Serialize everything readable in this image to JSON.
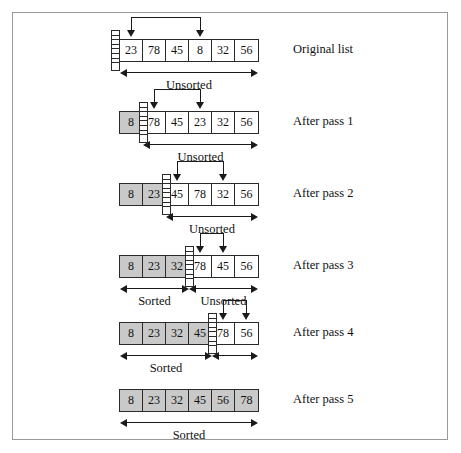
{
  "figure": {
    "type": "selection-sort-diagram",
    "cell_width": 23,
    "cell_height": 21,
    "array_left": 118,
    "colors": {
      "shaded_cell": "#c9c9c9",
      "plain_cell": "#ffffff",
      "stroke": "#2b2b2b",
      "frame": "#9a9a9a"
    }
  },
  "rows": [
    {
      "id": "original",
      "label": "Original list",
      "top": 38,
      "values": [
        "23",
        "78",
        "45",
        "8",
        "32",
        "56"
      ],
      "sorted_count": 0,
      "swap_from_index": 0,
      "swap_to_index": 3,
      "spans": [
        {
          "name": "unsorted",
          "label": "Unsorted",
          "start_index": 0,
          "end_index": 6
        }
      ]
    },
    {
      "id": "pass1",
      "label": "After pass 1",
      "top": 110,
      "values": [
        "8",
        "78",
        "45",
        "23",
        "32",
        "56"
      ],
      "sorted_count": 1,
      "swap_from_index": 1,
      "swap_to_index": 3,
      "spans": [
        {
          "name": "unsorted",
          "label": "Unsorted",
          "start_index": 1,
          "end_index": 6
        }
      ]
    },
    {
      "id": "pass2",
      "label": "After pass 2",
      "top": 182,
      "values": [
        "8",
        "23",
        "45",
        "78",
        "32",
        "56"
      ],
      "sorted_count": 2,
      "swap_from_index": 2,
      "swap_to_index": 4,
      "spans": [
        {
          "name": "unsorted",
          "label": "Unsorted",
          "start_index": 2,
          "end_index": 6
        }
      ]
    },
    {
      "id": "pass3",
      "label": "After pass 3",
      "top": 254,
      "values": [
        "8",
        "23",
        "32",
        "78",
        "45",
        "56"
      ],
      "sorted_count": 3,
      "swap_from_index": 3,
      "swap_to_index": 4,
      "spans": [
        {
          "name": "sorted",
          "label": "Sorted",
          "start_index": 0,
          "end_index": 3
        },
        {
          "name": "unsorted",
          "label": "Unsorted",
          "start_index": 3,
          "end_index": 6
        }
      ]
    },
    {
      "id": "pass4",
      "label": "After pass 4",
      "top": 321,
      "values": [
        "8",
        "23",
        "32",
        "45",
        "78",
        "56"
      ],
      "sorted_count": 4,
      "swap_from_index": 4,
      "swap_to_index": 5,
      "spans": [
        {
          "name": "sorted",
          "label": "Sorted",
          "start_index": 0,
          "end_index": 4
        },
        {
          "name": "unsorted",
          "label": "",
          "start_index": 4,
          "end_index": 6
        }
      ]
    },
    {
      "id": "pass5",
      "label": "After pass 5",
      "top": 388,
      "values": [
        "8",
        "23",
        "32",
        "45",
        "56",
        "78"
      ],
      "sorted_count": 6,
      "swap_from_index": null,
      "swap_to_index": null,
      "spans": [
        {
          "name": "sorted",
          "label": "Sorted",
          "start_index": 0,
          "end_index": 6
        }
      ]
    }
  ]
}
